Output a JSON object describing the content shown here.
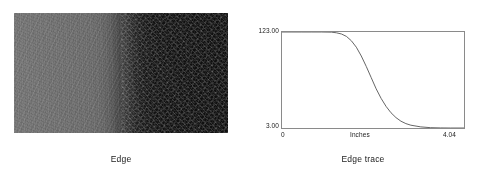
{
  "figure": {
    "panels": [
      {
        "id": "edge-image",
        "caption": "Edge",
        "kind": "grayscale-image",
        "description": "Horizontal grayscale edge: uniform mid-gray on the left half transitioning through a smooth ramp to near-black on the right half, with visible film grain noise."
      },
      {
        "id": "edge-trace",
        "caption": "Edge trace",
        "kind": "line-plot"
      }
    ]
  },
  "chart_data": {
    "type": "line",
    "title": "Edge trace",
    "xlabel": "Inches",
    "ylabel": "",
    "xlim": [
      0,
      4.04
    ],
    "ylim": [
      3.0,
      123.0
    ],
    "grid": false,
    "legend": null,
    "xticks": [
      "0",
      "4.04"
    ],
    "yticks": [
      "123.00",
      "3.00"
    ],
    "x_tick_values": [
      0,
      4.04
    ],
    "y_tick_values": [
      3.0,
      123.0
    ],
    "series": [
      {
        "name": "Edge trace",
        "color": "#555555",
        "x": [
          0.0,
          0.22,
          0.44,
          0.66,
          0.88,
          1.1,
          1.21,
          1.32,
          1.43,
          1.54,
          1.65,
          1.76,
          1.87,
          1.98,
          2.09,
          2.2,
          2.31,
          2.42,
          2.53,
          2.64,
          2.75,
          2.86,
          3.08,
          3.3,
          3.52,
          3.74,
          4.04
        ],
        "values": [
          123.0,
          123.0,
          123.0,
          123.0,
          123.0,
          122.8,
          122.0,
          120.5,
          117.5,
          112.0,
          104.0,
          93.0,
          80.0,
          66.0,
          52.0,
          40.0,
          30.0,
          22.0,
          16.0,
          11.5,
          8.5,
          6.5,
          4.4,
          3.4,
          3.1,
          3.0,
          3.0
        ]
      }
    ],
    "annotations": []
  },
  "colors": {
    "background": "#ffffff",
    "axis": "#8a8a8a",
    "curve": "#555555",
    "text": "#1a1a1a",
    "image_light": "#757575",
    "image_dark": "#101010"
  }
}
